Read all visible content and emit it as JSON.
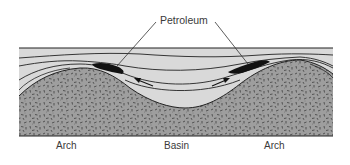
{
  "diagram": {
    "type": "geologic cross-section",
    "callout": {
      "label": "Petroleum",
      "targets": [
        "left-trap",
        "right-trap"
      ]
    },
    "regions": [
      {
        "id": "arch-left",
        "label": "Arch"
      },
      {
        "id": "basin",
        "label": "Basin"
      },
      {
        "id": "arch-right",
        "label": "Arch"
      }
    ],
    "layers": [
      {
        "name": "overlying-strata",
        "fill": "#d9d9d9"
      },
      {
        "name": "sedimentary-layers",
        "fill": "#d4d4d4"
      },
      {
        "name": "basement-rock",
        "fill": "#9c9c9c",
        "pattern": "speckled"
      }
    ],
    "arrows": [
      {
        "name": "migration-arrow-left",
        "direction": "up-left"
      },
      {
        "name": "migration-arrow-right",
        "direction": "up-right"
      }
    ],
    "colors": {
      "line": "#222222",
      "petroleum": "#111111",
      "strata": "#d9d9d9",
      "basement": "#9c9c9c",
      "background": "#ffffff"
    }
  }
}
